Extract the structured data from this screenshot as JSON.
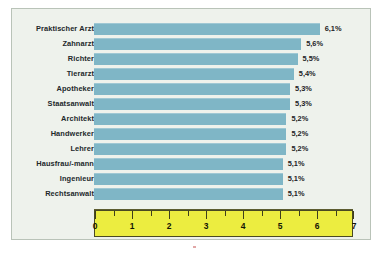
{
  "chart_data": {
    "type": "bar",
    "orientation": "horizontal",
    "title": "",
    "subtitle": "",
    "xlabel": "",
    "ylabel": "",
    "xlim": [
      0,
      7
    ],
    "grid": false,
    "legend": null,
    "value_suffix": "%",
    "decimal_separator": ",",
    "categories": [
      "Praktischer Arzt",
      "Zahnarzt",
      "Richter",
      "Tierarzt",
      "Apotheker",
      "Staatsanwalt",
      "Architekt",
      "Handwerker",
      "Lehrer",
      "Hausfrau/-mann",
      "Ingenieur",
      "Rechtsanwalt"
    ],
    "values": [
      6.1,
      5.6,
      5.5,
      5.4,
      5.3,
      5.3,
      5.2,
      5.2,
      5.2,
      5.1,
      5.1,
      5.1
    ],
    "value_labels": [
      "6,1%",
      "5,6%",
      "5,5%",
      "5,4%",
      "5,3%",
      "5,3%",
      "5,2%",
      "5,2%",
      "5,2%",
      "5,1%",
      "5,1%",
      "5,1%"
    ],
    "x_ticks": [
      0,
      1,
      2,
      3,
      4,
      5,
      6,
      7
    ],
    "x_tick_labels": [
      "0",
      "1",
      "2",
      "3",
      "4",
      "5",
      "6",
      "7"
    ],
    "x_minor_ticks": [
      0.5,
      1.5,
      2.5,
      3.5,
      4.5,
      5.5,
      6.5
    ],
    "colors": {
      "bar": "#7fb6c6",
      "axis_band": "#eced40",
      "panel_background": "#eef2ec",
      "page_background": "#ffffff",
      "text": "#22282b",
      "axis_line": "#3f3f1c"
    }
  }
}
